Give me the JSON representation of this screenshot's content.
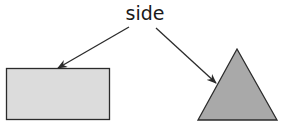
{
  "diagram": {
    "label": "side",
    "colors": {
      "stroke": "#2b2b2b",
      "rectangle_fill": "#dcdcdc",
      "triangle_fill": "#a9a9a9",
      "text": "#1a1a1a"
    },
    "shapes": [
      {
        "type": "rectangle",
        "label": "rectangle"
      },
      {
        "type": "triangle",
        "label": "triangle"
      }
    ],
    "arrows": [
      {
        "from": "side",
        "to": "rectangle top edge"
      },
      {
        "from": "side",
        "to": "triangle left edge"
      }
    ]
  }
}
